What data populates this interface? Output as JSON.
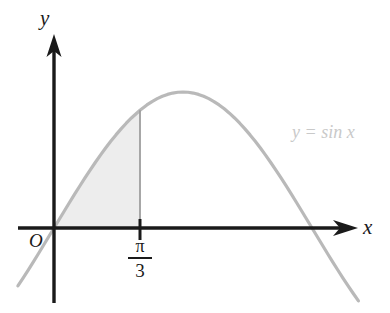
{
  "figure": {
    "background_color": "#ffffff",
    "width": 390,
    "height": 313
  },
  "axes": {
    "x_axis_label": "x",
    "y_axis_label": "y",
    "origin_label": "O",
    "axis_color": "#1a1a1a",
    "origin_px": {
      "x": 54,
      "y": 228
    },
    "x_axis_from_px": 18,
    "x_axis_to_px": 357,
    "y_axis_top_px": 38,
    "y_axis_bottom_px": 303
  },
  "ticks": {
    "x": [
      {
        "numerator": "π",
        "denominator": "3",
        "value_text": "π/3",
        "pixel_x": 138
      }
    ]
  },
  "curve": {
    "label": "y = sin x",
    "color": "#b9b9b9",
    "stroke_width": 3,
    "label_color": "#c9c9c9"
  },
  "shaded_region": {
    "fill_color": "#ededed",
    "from": "0",
    "to": "π/3",
    "divider_color": "#9e9e9e"
  },
  "chart_data": {
    "type": "line",
    "title": "",
    "xlabel": "x",
    "ylabel": "y",
    "function": "y = sin x",
    "legend": [
      "y = sin x"
    ],
    "legend_position": "upper-right-inside",
    "grid": false,
    "xlim": [
      -0.14,
      1.18
    ],
    "ylim": [
      -0.37,
      1.13
    ],
    "xlim_unit": "pi",
    "x_tick_values": [
      0.3333333
    ],
    "x_tick_labels": [
      "π/3"
    ],
    "x_tick_unit": "pi",
    "y_tick_values": [],
    "y_tick_labels": [],
    "annotations": [
      {
        "text": "O",
        "x": 0,
        "y": 0,
        "role": "origin-label"
      },
      {
        "text": "y = sin x",
        "x": 0.92,
        "y": 0.58,
        "role": "curve-label"
      }
    ],
    "shaded_area": {
      "x_from": 0,
      "x_to": 0.3333333,
      "unit": "pi",
      "under_curve": "y = sin x",
      "fill": "#ededed"
    },
    "series": [
      {
        "name": "y = sin x",
        "x": [
          -0.14,
          -0.12,
          -0.1,
          -0.08,
          -0.06,
          -0.04,
          -0.02,
          0.0,
          0.02,
          0.04,
          0.06,
          0.08,
          0.1,
          0.12,
          0.14,
          0.16,
          0.18,
          0.2,
          0.22,
          0.24,
          0.26,
          0.28,
          0.3,
          0.3333333,
          0.36,
          0.38,
          0.4,
          0.42,
          0.44,
          0.46,
          0.48,
          0.5,
          0.52,
          0.54,
          0.56,
          0.58,
          0.6,
          0.62,
          0.64,
          0.66,
          0.68,
          0.7,
          0.72,
          0.74,
          0.76,
          0.78,
          0.8,
          0.82,
          0.84,
          0.86,
          0.88,
          0.9,
          0.92,
          0.94,
          0.96,
          0.98,
          1.0,
          1.02,
          1.04,
          1.06,
          1.08,
          1.1,
          1.12,
          1.14,
          1.16,
          1.18
        ],
        "x_unit": "pi",
        "y": [
          -0.4258,
          -0.3681,
          -0.309,
          -0.2487,
          -0.1874,
          -0.1253,
          -0.0628,
          0.0,
          0.0628,
          0.1253,
          0.1874,
          0.2487,
          0.309,
          0.3681,
          0.4258,
          0.4818,
          0.5358,
          0.5878,
          0.6374,
          0.6845,
          0.729,
          0.7705,
          0.809,
          0.866,
          0.9048,
          0.9298,
          0.9511,
          0.9686,
          0.9823,
          0.9921,
          0.998,
          1.0,
          0.998,
          0.9921,
          0.9823,
          0.9686,
          0.9511,
          0.9298,
          0.9048,
          0.8763,
          0.8443,
          0.809,
          0.7705,
          0.729,
          0.6845,
          0.6374,
          0.5878,
          0.5358,
          0.4818,
          0.4258,
          0.3681,
          0.309,
          0.2487,
          0.1874,
          0.1253,
          0.0628,
          0.0,
          -0.0628,
          -0.1253,
          -0.1874,
          -0.2487,
          -0.309,
          -0.3681,
          -0.4258,
          -0.4818,
          -0.5358
        ]
      }
    ]
  }
}
